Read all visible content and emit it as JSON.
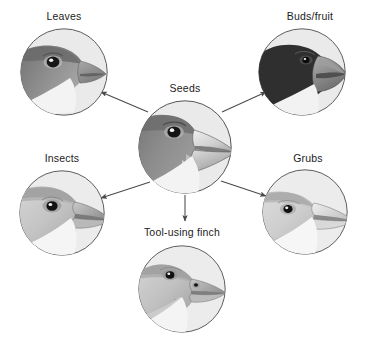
{
  "diagram": {
    "type": "radial-divergence-diagram",
    "background_color": "#ffffff",
    "label_color": "#1b1b1b",
    "arrow_color": "#4a4a4a",
    "circle_outline_color": "#4d4d4d",
    "circle_fill_color": "#e9e9e9",
    "center": {
      "id": "seeds",
      "label": "Seeds",
      "label_x": 155,
      "label_y": 82,
      "circle_cx": 185,
      "circle_cy": 147,
      "circle_r": 47,
      "beak_type": "large-deep-crushing",
      "head_tone": "#8e8e8e",
      "beak_tone": "#d9d9d9"
    },
    "branches": [
      {
        "id": "leaves",
        "label": "Leaves",
        "label_x": -16,
        "label_y": 10,
        "circle_cx": 64,
        "circle_cy": 72,
        "circle_r": 44,
        "beak_type": "medium-conical",
        "head_tone": "#8a8a8a",
        "beak_tone": "#a3a3a3",
        "arrow": {
          "x1": 148,
          "y1": 112,
          "x2": 101,
          "y2": 92
        }
      },
      {
        "id": "buds-fruit",
        "label": "Buds/fruit",
        "label_x": 230,
        "label_y": 10,
        "circle_cx": 302,
        "circle_cy": 72,
        "circle_r": 44,
        "beak_type": "thick-blunt-dark",
        "head_tone": "#3a3a3a",
        "beak_tone": "#8f8f8f",
        "arrow": {
          "x1": 222,
          "y1": 112,
          "x2": 266,
          "y2": 92
        }
      },
      {
        "id": "insects",
        "label": "Insects",
        "label_x": -18,
        "label_y": 152,
        "circle_cx": 62,
        "circle_cy": 213,
        "circle_r": 43,
        "beak_type": "slender-pointed",
        "head_tone": "#cfcfcf",
        "beak_tone": "#c2c2c2",
        "arrow": {
          "x1": 150,
          "y1": 182,
          "x2": 101,
          "y2": 198
        }
      },
      {
        "id": "grubs",
        "label": "Grubs",
        "label_x": 228,
        "label_y": 152,
        "circle_cx": 305,
        "circle_cy": 212,
        "circle_r": 43,
        "beak_type": "long-straight-probing",
        "head_tone": "#d3d3d3",
        "beak_tone": "#e2e2e2",
        "arrow": {
          "x1": 221,
          "y1": 181,
          "x2": 266,
          "y2": 196
        }
      },
      {
        "id": "tool-using-finch",
        "label": "Tool-using finch",
        "label_x": 102,
        "label_y": 226,
        "circle_cx": 182,
        "circle_cy": 289,
        "circle_r": 44,
        "beak_type": "straight-with-twig-tool",
        "head_tone": "#c9c9c9",
        "beak_tone": "#b5b5b5",
        "arrow": {
          "x1": 185,
          "y1": 195,
          "x2": 185,
          "y2": 221
        }
      }
    ]
  }
}
